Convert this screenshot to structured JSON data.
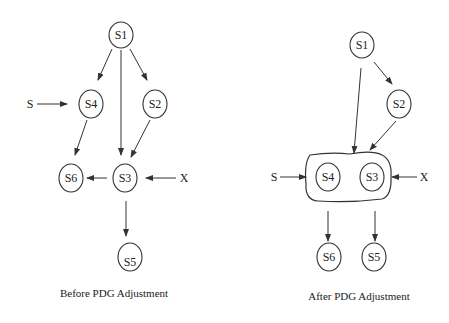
{
  "diagrams": [
    {
      "caption": "Before PDG Adjustment",
      "nodes": [
        {
          "id": "S1",
          "label": "S1"
        },
        {
          "id": "S4",
          "label": "S4"
        },
        {
          "id": "S2",
          "label": "S2"
        },
        {
          "id": "S6",
          "label": "S6"
        },
        {
          "id": "S3",
          "label": "S3"
        },
        {
          "id": "S5",
          "label": "S5"
        }
      ],
      "inputs": [
        {
          "label": "S",
          "target": "S4"
        },
        {
          "label": "X",
          "target": "S3"
        }
      ],
      "edges": [
        [
          "S1",
          "S4"
        ],
        [
          "S1",
          "S3"
        ],
        [
          "S1",
          "S2"
        ],
        [
          "S2",
          "S3"
        ],
        [
          "S4",
          "S6"
        ],
        [
          "S3",
          "S6"
        ],
        [
          "S3",
          "S5"
        ]
      ]
    },
    {
      "caption": "After PDG Adjustment",
      "nodes": [
        {
          "id": "S1",
          "label": "S1"
        },
        {
          "id": "S2",
          "label": "S2"
        },
        {
          "id": "S4",
          "label": "S4"
        },
        {
          "id": "S3",
          "label": "S3"
        },
        {
          "id": "S6",
          "label": "S6"
        },
        {
          "id": "S5",
          "label": "S5"
        }
      ],
      "group": [
        "S4",
        "S3"
      ],
      "inputs": [
        {
          "label": "S",
          "target": "group"
        },
        {
          "label": "X",
          "target": "group"
        }
      ],
      "edges": [
        [
          "S1",
          "group"
        ],
        [
          "S1",
          "S2"
        ],
        [
          "S2",
          "group"
        ],
        [
          "group",
          "S6"
        ],
        [
          "group",
          "S5"
        ]
      ]
    }
  ]
}
